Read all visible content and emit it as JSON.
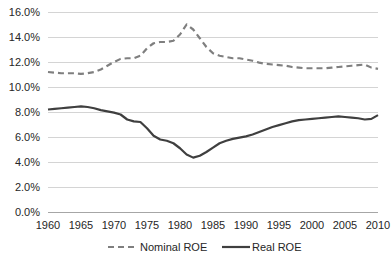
{
  "chart_data": {
    "type": "line",
    "title": "",
    "subtitle": "",
    "xlabel": "",
    "ylabel": "",
    "xlim": [
      1960,
      2010
    ],
    "ylim": [
      0,
      16
    ],
    "grid": true,
    "grid_axis": "y",
    "legend_position": "bottom",
    "y_tick_labels": [
      "0.0%",
      "2.0%",
      "4.0%",
      "6.0%",
      "8.0%",
      "10.0%",
      "12.0%",
      "14.0%",
      "16.0%"
    ],
    "y_tick_values": [
      0,
      2,
      4,
      6,
      8,
      10,
      12,
      14,
      16
    ],
    "x_tick_labels": [
      "1960",
      "1965",
      "1970",
      "1975",
      "1980",
      "1985",
      "1990",
      "1995",
      "2000",
      "2005",
      "2010"
    ],
    "x_tick_values": [
      1960,
      1965,
      1970,
      1975,
      1980,
      1985,
      1990,
      1995,
      2000,
      2005,
      2010
    ],
    "x": [
      1960,
      1961,
      1962,
      1963,
      1964,
      1965,
      1966,
      1967,
      1968,
      1969,
      1970,
      1971,
      1972,
      1973,
      1974,
      1975,
      1976,
      1977,
      1978,
      1979,
      1980,
      1981,
      1982,
      1983,
      1984,
      1985,
      1986,
      1987,
      1988,
      1989,
      1990,
      1991,
      1992,
      1993,
      1994,
      1995,
      1996,
      1997,
      1998,
      1999,
      2000,
      2001,
      2002,
      2003,
      2004,
      2005,
      2006,
      2007,
      2008,
      2009,
      2010
    ],
    "series": [
      {
        "name": "Nominal ROE",
        "style": "dashed",
        "color": "#7f7f7f",
        "values": [
          11.2,
          11.15,
          11.1,
          11.1,
          11.1,
          11.05,
          11.1,
          11.2,
          11.4,
          11.7,
          12.0,
          12.25,
          12.3,
          12.3,
          12.5,
          13.1,
          13.5,
          13.6,
          13.6,
          13.7,
          14.2,
          15.0,
          14.6,
          13.9,
          13.2,
          12.7,
          12.5,
          12.4,
          12.3,
          12.3,
          12.2,
          12.1,
          11.95,
          11.85,
          11.8,
          11.75,
          11.7,
          11.6,
          11.55,
          11.5,
          11.5,
          11.5,
          11.5,
          11.55,
          11.6,
          11.65,
          11.7,
          11.75,
          11.8,
          11.55,
          11.45
        ]
      },
      {
        "name": "Real ROE",
        "style": "solid",
        "color": "#3f3f3f",
        "values": [
          8.2,
          8.25,
          8.3,
          8.35,
          8.4,
          8.45,
          8.4,
          8.3,
          8.15,
          8.05,
          7.95,
          7.8,
          7.4,
          7.25,
          7.2,
          6.7,
          6.1,
          5.8,
          5.7,
          5.5,
          5.1,
          4.6,
          4.35,
          4.5,
          4.8,
          5.15,
          5.5,
          5.7,
          5.85,
          5.95,
          6.05,
          6.2,
          6.4,
          6.6,
          6.8,
          6.95,
          7.1,
          7.25,
          7.35,
          7.4,
          7.45,
          7.5,
          7.55,
          7.6,
          7.65,
          7.6,
          7.55,
          7.5,
          7.4,
          7.45,
          7.75
        ]
      }
    ],
    "legend": [
      {
        "label": "Nominal ROE",
        "style": "dashed",
        "color": "#7f7f7f"
      },
      {
        "label": "Real ROE",
        "style": "solid",
        "color": "#3f3f3f"
      }
    ]
  }
}
